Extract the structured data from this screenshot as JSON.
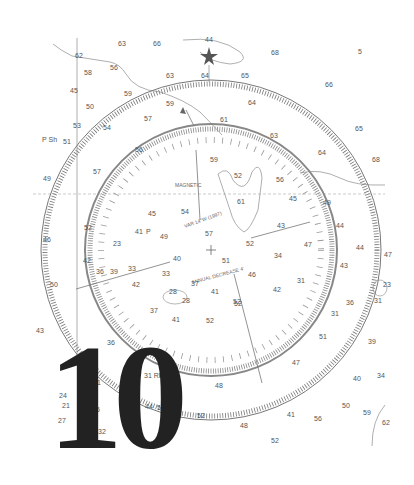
{
  "figure": {
    "type": "nautical-chart-excerpt",
    "overlay_number": "10",
    "colors": {
      "background": "#ffffff",
      "ink": "#555555",
      "numeral": "#222222",
      "ring": "#888888"
    }
  },
  "compass_rose": {
    "center": [
      211,
      250
    ],
    "outer_radius": 170,
    "inner_radius": 126,
    "inner_label_top": "MAGNETIC",
    "inner_label_arc_1": "VAR 14°W (1997)",
    "inner_label_arc_2": "ANNUAL DECREASE 4'"
  },
  "landmarks": [
    {
      "name": "star-marker",
      "x": 209,
      "y": 57
    }
  ],
  "soundings": [
    {
      "v": "63",
      "x": 118,
      "y": 46
    },
    {
      "v": "66",
      "x": 153,
      "y": 46
    },
    {
      "v": "44",
      "x": 205,
      "y": 42
    },
    {
      "v": "68",
      "x": 271,
      "y": 55
    },
    {
      "v": "5",
      "x": 358,
      "y": 54
    },
    {
      "v": "62",
      "x": 75,
      "y": 58
    },
    {
      "v": "56",
      "x": 110,
      "y": 70
    },
    {
      "v": "63",
      "x": 166,
      "y": 78
    },
    {
      "v": "64",
      "x": 201,
      "y": 78
    },
    {
      "v": "65",
      "x": 241,
      "y": 78
    },
    {
      "v": "58",
      "x": 84,
      "y": 75
    },
    {
      "v": "45",
      "x": 70,
      "y": 93
    },
    {
      "v": "59",
      "x": 124,
      "y": 96
    },
    {
      "v": "66",
      "x": 325,
      "y": 87
    },
    {
      "v": "50",
      "x": 86,
      "y": 109
    },
    {
      "v": "59",
      "x": 166,
      "y": 106
    },
    {
      "v": "57",
      "x": 144,
      "y": 121
    },
    {
      "v": "64",
      "x": 248,
      "y": 105
    },
    {
      "v": "53",
      "x": 73,
      "y": 128
    },
    {
      "v": "54",
      "x": 103,
      "y": 130
    },
    {
      "v": "61",
      "x": 220,
      "y": 122
    },
    {
      "v": "63",
      "x": 270,
      "y": 138
    },
    {
      "v": "65",
      "x": 355,
      "y": 131
    },
    {
      "v": "P Sh",
      "x": 42,
      "y": 142
    },
    {
      "v": "51",
      "x": 63,
      "y": 144
    },
    {
      "v": "56",
      "x": 135,
      "y": 152
    },
    {
      "v": "59",
      "x": 210,
      "y": 162
    },
    {
      "v": "64",
      "x": 318,
      "y": 155
    },
    {
      "v": "68",
      "x": 372,
      "y": 162
    },
    {
      "v": "49",
      "x": 43,
      "y": 181
    },
    {
      "v": "57",
      "x": 93,
      "y": 174
    },
    {
      "v": "52",
      "x": 234,
      "y": 178
    },
    {
      "v": "56",
      "x": 276,
      "y": 182
    },
    {
      "v": "45",
      "x": 148,
      "y": 216
    },
    {
      "v": "54",
      "x": 181,
      "y": 214
    },
    {
      "v": "61",
      "x": 237,
      "y": 204
    },
    {
      "v": "45",
      "x": 289,
      "y": 201
    },
    {
      "v": "49",
      "x": 323,
      "y": 205
    },
    {
      "v": "52",
      "x": 84,
      "y": 230
    },
    {
      "v": "41",
      "x": 135,
      "y": 234
    },
    {
      "v": "P",
      "x": 146,
      "y": 234
    },
    {
      "v": "49",
      "x": 160,
      "y": 239
    },
    {
      "v": "57",
      "x": 205,
      "y": 236
    },
    {
      "v": "43",
      "x": 277,
      "y": 228
    },
    {
      "v": "44",
      "x": 336,
      "y": 228
    },
    {
      "v": "46",
      "x": 43,
      "y": 242
    },
    {
      "v": "23",
      "x": 113,
      "y": 246
    },
    {
      "v": "52",
      "x": 246,
      "y": 246
    },
    {
      "v": "47",
      "x": 304,
      "y": 247
    },
    {
      "v": "44",
      "x": 356,
      "y": 250
    },
    {
      "v": "47",
      "x": 384,
      "y": 257
    },
    {
      "v": "42",
      "x": 83,
      "y": 263
    },
    {
      "v": "40",
      "x": 173,
      "y": 261
    },
    {
      "v": "51",
      "x": 222,
      "y": 263
    },
    {
      "v": "34",
      "x": 274,
      "y": 258
    },
    {
      "v": "36",
      "x": 96,
      "y": 274
    },
    {
      "v": "39",
      "x": 110,
      "y": 274
    },
    {
      "v": "33",
      "x": 128,
      "y": 271
    },
    {
      "v": "33",
      "x": 162,
      "y": 276
    },
    {
      "v": "46",
      "x": 248,
      "y": 277
    },
    {
      "v": "43",
      "x": 340,
      "y": 268
    },
    {
      "v": "50",
      "x": 50,
      "y": 287
    },
    {
      "v": "42",
      "x": 132,
      "y": 287
    },
    {
      "v": "37",
      "x": 191,
      "y": 286
    },
    {
      "v": "41",
      "x": 211,
      "y": 294
    },
    {
      "v": "42",
      "x": 273,
      "y": 292
    },
    {
      "v": "31",
      "x": 297,
      "y": 283
    },
    {
      "v": "23",
      "x": 383,
      "y": 287
    },
    {
      "v": "28",
      "x": 169,
      "y": 294
    },
    {
      "v": "28",
      "x": 182,
      "y": 303
    },
    {
      "v": "37",
      "x": 150,
      "y": 313
    },
    {
      "v": "41",
      "x": 172,
      "y": 322
    },
    {
      "v": "52",
      "x": 233,
      "y": 304
    },
    {
      "v": "52",
      "x": 206,
      "y": 323
    },
    {
      "v": "52",
      "x": 234,
      "y": 306
    },
    {
      "v": "31",
      "x": 374,
      "y": 303
    },
    {
      "v": "36",
      "x": 346,
      "y": 305
    },
    {
      "v": "31",
      "x": 331,
      "y": 316
    },
    {
      "v": "43",
      "x": 36,
      "y": 333
    },
    {
      "v": "36",
      "x": 107,
      "y": 345
    },
    {
      "v": "51",
      "x": 319,
      "y": 339
    },
    {
      "v": "39",
      "x": 368,
      "y": 344
    },
    {
      "v": "47",
      "x": 292,
      "y": 365
    },
    {
      "v": "40",
      "x": 353,
      "y": 381
    },
    {
      "v": "34",
      "x": 377,
      "y": 378
    },
    {
      "v": "31",
      "x": 93,
      "y": 385
    },
    {
      "v": "31",
      "x": 124,
      "y": 370
    },
    {
      "v": "31 Rk",
      "x": 144,
      "y": 378
    },
    {
      "v": "48",
      "x": 215,
      "y": 388
    },
    {
      "v": "24",
      "x": 59,
      "y": 398
    },
    {
      "v": "21",
      "x": 62,
      "y": 408
    },
    {
      "v": "35",
      "x": 92,
      "y": 412
    },
    {
      "v": "44",
      "x": 145,
      "y": 409
    },
    {
      "v": "56",
      "x": 157,
      "y": 410
    },
    {
      "v": "50",
      "x": 342,
      "y": 408
    },
    {
      "v": "59",
      "x": 363,
      "y": 415
    },
    {
      "v": "62",
      "x": 382,
      "y": 425
    },
    {
      "v": "27",
      "x": 58,
      "y": 423
    },
    {
      "v": "52",
      "x": 197,
      "y": 418
    },
    {
      "v": "48",
      "x": 240,
      "y": 428
    },
    {
      "v": "41",
      "x": 287,
      "y": 417
    },
    {
      "v": "56",
      "x": 314,
      "y": 421
    },
    {
      "v": "52",
      "x": 271,
      "y": 443
    },
    {
      "v": "32",
      "x": 98,
      "y": 434
    }
  ]
}
